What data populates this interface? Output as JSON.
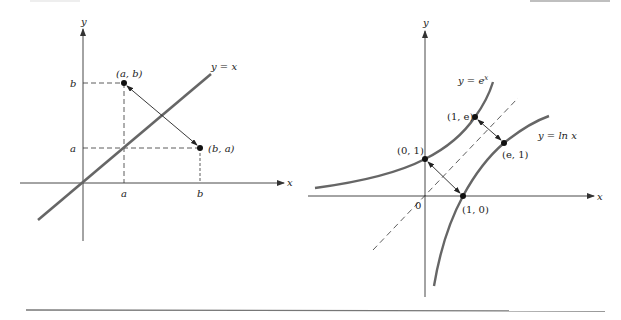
{
  "left_graph": {
    "axis_x_label": "x",
    "axis_y_label": "y",
    "line_label": "y = x",
    "point_ab_label": "(a, b)",
    "point_ba_label": "(b, a)",
    "tick_x_a": "a",
    "tick_x_b": "b",
    "tick_y_a": "a",
    "tick_y_b": "b"
  },
  "right_graph": {
    "axis_x_label": "x",
    "axis_y_label": "y",
    "origin_label": "0",
    "curve_exp_label": "y = e",
    "curve_exp_superscript": "x",
    "curve_ln_label": "y = ln x",
    "point_01_label": "(0, 1)",
    "point_10_label": "(1, 0)",
    "point_1e_label": "(1, e)",
    "point_e1_label": "(e, 1)"
  },
  "colors": {
    "curve": "#666666",
    "axis": "#333333",
    "text": "#222222"
  }
}
